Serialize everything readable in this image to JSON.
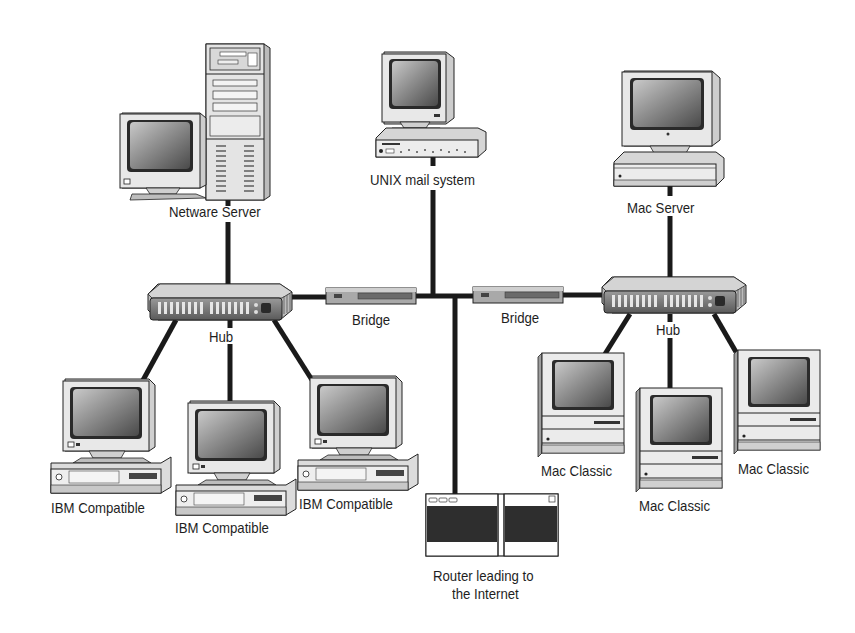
{
  "diagram": {
    "type": "network-topology",
    "colors": {
      "line": "#1a1a1a",
      "device_body": "#e6e6e6",
      "device_shade": "#b8b8b8",
      "screen": "#8a8a8a",
      "screen_dark": "#3a3a3a",
      "text": "#1e1e1e",
      "background": "#ffffff"
    },
    "nodes": {
      "netware_server": {
        "label": "Netware Server",
        "kind": "tower-server-with-monitor"
      },
      "unix_mail": {
        "label": "UNIX mail system",
        "kind": "desktop-workstation"
      },
      "mac_server": {
        "label": "Mac Server",
        "kind": "desktop-workstation"
      },
      "hub_left": {
        "label": "Hub",
        "kind": "hub"
      },
      "hub_right": {
        "label": "Hub",
        "kind": "hub"
      },
      "bridge_left": {
        "label": "Bridge",
        "kind": "bridge"
      },
      "bridge_right": {
        "label": "Bridge",
        "kind": "bridge"
      },
      "ibm_1": {
        "label": "IBM Compatible",
        "kind": "pc"
      },
      "ibm_2": {
        "label": "IBM Compatible",
        "kind": "pc"
      },
      "ibm_3": {
        "label": "IBM Compatible",
        "kind": "pc"
      },
      "mac_1": {
        "label": "Mac Classic",
        "kind": "mac-classic"
      },
      "mac_2": {
        "label": "Mac Classic",
        "kind": "mac-classic"
      },
      "mac_3": {
        "label": "Mac Classic",
        "kind": "mac-classic"
      },
      "router": {
        "label_line1": "Router leading to",
        "label_line2": "the Internet",
        "kind": "router"
      }
    },
    "edges": [
      [
        "netware_server",
        "hub_left"
      ],
      [
        "hub_left",
        "bridge_left"
      ],
      [
        "bridge_left",
        "backbone"
      ],
      [
        "unix_mail",
        "backbone"
      ],
      [
        "backbone",
        "router"
      ],
      [
        "backbone",
        "bridge_right"
      ],
      [
        "bridge_right",
        "hub_right"
      ],
      [
        "mac_server",
        "hub_right"
      ],
      [
        "hub_left",
        "ibm_1"
      ],
      [
        "hub_left",
        "ibm_2"
      ],
      [
        "hub_left",
        "ibm_3"
      ],
      [
        "hub_right",
        "mac_1"
      ],
      [
        "hub_right",
        "mac_2"
      ],
      [
        "hub_right",
        "mac_3"
      ]
    ]
  }
}
